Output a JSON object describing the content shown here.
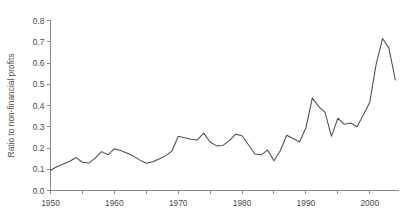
{
  "chart_data": {
    "type": "line",
    "title": "",
    "xlabel": "",
    "ylabel": "Ratio to non-financial profits",
    "xlim": [
      1950,
      2004.5
    ],
    "ylim": [
      0.0,
      0.8
    ],
    "grid": false,
    "legend": null,
    "y_ticks": [
      "0.0",
      "0.1",
      "0.2",
      "0.3",
      "0.4",
      "0.5",
      "0.6",
      "0.7",
      "0.8"
    ],
    "y_tick_values": [
      0.0,
      0.1,
      0.2,
      0.3,
      0.4,
      0.5,
      0.6,
      0.7,
      0.8
    ],
    "x_ticks": [
      "1950",
      "1960",
      "1970",
      "1980",
      "1990",
      "2000"
    ],
    "x_tick_values": [
      1950,
      1960,
      1970,
      1980,
      1990,
      2000
    ],
    "x_minor_tick_values": [
      1955,
      1965,
      1975,
      1985,
      1995
    ],
    "line_color": "#4d4d4d",
    "axis_color": "#8a8a8a",
    "series": [
      {
        "name": "Ratio to non-financial profits",
        "x": [
          1950,
          1951,
          1952,
          1953,
          1954,
          1955,
          1956,
          1957,
          1958,
          1959,
          1960,
          1961,
          1962,
          1963,
          1964,
          1965,
          1966,
          1967,
          1968,
          1969,
          1970,
          1971,
          1972,
          1973,
          1974,
          1975,
          1976,
          1977,
          1978,
          1979,
          1980,
          1981,
          1982,
          1983,
          1984,
          1985,
          1986,
          1987,
          1988,
          1989,
          1990,
          1991,
          1992,
          1993,
          1994,
          1995,
          1996,
          1997,
          1998,
          1999,
          2000,
          2001,
          2002,
          2003,
          2004
        ],
        "values": [
          0.095,
          0.112,
          0.125,
          0.138,
          0.155,
          0.133,
          0.129,
          0.152,
          0.183,
          0.168,
          0.196,
          0.188,
          0.175,
          0.162,
          0.143,
          0.128,
          0.135,
          0.148,
          0.163,
          0.185,
          0.255,
          0.248,
          0.241,
          0.238,
          0.27,
          0.228,
          0.21,
          0.212,
          0.235,
          0.265,
          0.258,
          0.215,
          0.172,
          0.168,
          0.19,
          0.14,
          0.188,
          0.26,
          0.245,
          0.228,
          0.295,
          0.435,
          0.395,
          0.368,
          0.255,
          0.34,
          0.312,
          0.318,
          0.3,
          0.355,
          0.415,
          0.595,
          0.715,
          0.67,
          0.52
        ]
      }
    ]
  }
}
